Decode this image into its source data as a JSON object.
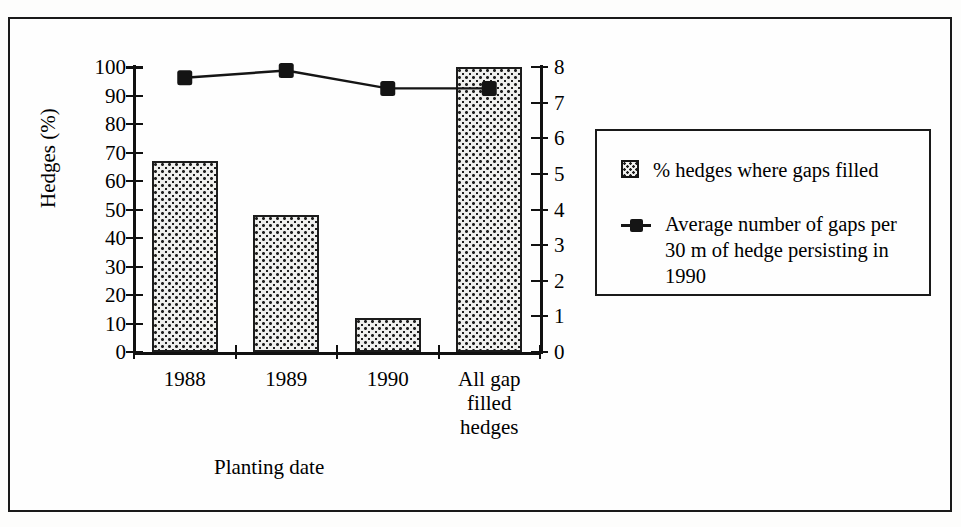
{
  "figure": {
    "frame": true
  },
  "chart_data": {
    "type": "bar",
    "title": "",
    "subtitle": "",
    "xlabel": "Planting date",
    "ylabel": "Hedges (%)",
    "ylabel_secondary": "",
    "categories": [
      "1988",
      "1989",
      "1990",
      "All gap\nfilled\nhedges"
    ],
    "grid": false,
    "legend_position": "right",
    "ylim": [
      0,
      100
    ],
    "yticks": [
      0,
      10,
      20,
      30,
      40,
      50,
      60,
      70,
      80,
      90,
      100
    ],
    "ytick_labels": [
      "0",
      "10",
      "20",
      "30",
      "40",
      "50",
      "60",
      "70",
      "80",
      "90",
      "100"
    ],
    "ylim_secondary": [
      0,
      8
    ],
    "yticks_secondary": [
      0,
      1,
      2,
      3,
      4,
      5,
      6,
      7,
      8
    ],
    "ytick_labels_secondary": [
      "0",
      "1",
      "2",
      "3",
      "4",
      "5",
      "6",
      "7",
      "8"
    ],
    "series": [
      {
        "name": "% hedges where gaps filled",
        "type": "bar",
        "axis": "left",
        "values": [
          67,
          48,
          12,
          100
        ]
      },
      {
        "name": "Average number of gaps per 30 m of hedge persisting in 1990",
        "type": "line",
        "axis": "right",
        "marker": "filled-square",
        "values": [
          7.7,
          7.9,
          7.4,
          7.4
        ]
      }
    ]
  },
  "legend": {
    "entries": [
      {
        "swatch": "stipple-patch",
        "label": "% hedges where gaps filled"
      },
      {
        "swatch": "line-marker",
        "label": "Average number of gaps per\n30 m of hedge persisting in\n1990"
      }
    ]
  }
}
